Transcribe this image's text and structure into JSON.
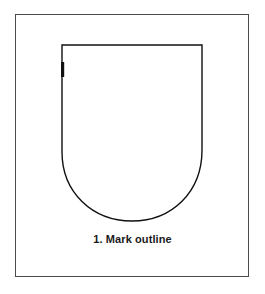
{
  "figure": {
    "caption": "1. Mark outline",
    "step_number": "1",
    "step_label": "Mark outline",
    "background_color": "#ffffff",
    "frame": {
      "name": "illustration-border",
      "stroke_color": "#4a4a4a",
      "stroke_width": 1,
      "x": 15,
      "y": 14,
      "width": 234,
      "height": 263
    },
    "shapes": [
      {
        "name": "shield-outline",
        "type": "shield",
        "stroke_color": "#111111",
        "stroke_width": 1.4,
        "fill": "none",
        "top_left": [
          62,
          45
        ],
        "top_right": [
          202,
          45
        ],
        "straight_side_bottom_left": [
          62,
          152
        ],
        "straight_side_bottom_right": [
          202,
          150
        ],
        "bottom_apex": [
          132,
          221
        ],
        "path": "M 62 45 L 202 45 L 202 150 C 202 192 172 221 132 221 C 92 221 62 192 62 152 Z"
      },
      {
        "name": "outline-tick-mark",
        "type": "mark",
        "color": "#111111",
        "x": 61,
        "y": 62,
        "width": 3.2,
        "height": 15
      }
    ]
  }
}
